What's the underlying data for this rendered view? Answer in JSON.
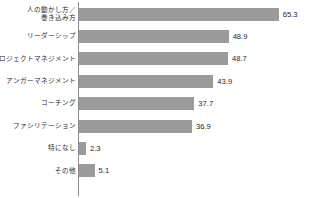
{
  "chart_data": {
    "type": "bar",
    "orientation": "horizontal",
    "title": "",
    "subtitle": "",
    "xlabel": "",
    "ylabel": "",
    "xlim": [
      0,
      70
    ],
    "grid": false,
    "legend": false,
    "bar_color": "#9b9b9b",
    "axis_color": "#8c8c8c",
    "value_label_suffix": "",
    "categories": [
      "人の動かし方／巻き込み方",
      "リーダーシップ",
      "プロジェクトマネジメント",
      "アンガーマネジメント",
      "コーチング",
      "ファシリテーション",
      "特になし",
      "その他"
    ],
    "values": [
      65.3,
      48.9,
      48.7,
      43.9,
      37.7,
      36.9,
      2.3,
      5.1
    ]
  },
  "bars": [
    {
      "label_line1": "人の動かし方／",
      "label_line2": "巻き込み方",
      "value": 65.3,
      "value_text": "65.3"
    },
    {
      "label_line1": "リーダーシップ",
      "label_line2": "",
      "value": 48.9,
      "value_text": "48.9"
    },
    {
      "label_line1": "プロジェクトマネジメント",
      "label_line2": "",
      "value": 48.7,
      "value_text": "48.7"
    },
    {
      "label_line1": "アンガーマネジメント",
      "label_line2": "",
      "value": 43.9,
      "value_text": "43.9"
    },
    {
      "label_line1": "コーチング",
      "label_line2": "",
      "value": 37.7,
      "value_text": "37.7"
    },
    {
      "label_line1": "ファシリテーション",
      "label_line2": "",
      "value": 36.9,
      "value_text": "36.9"
    },
    {
      "label_line1": "特になし",
      "label_line2": "",
      "value": 2.3,
      "value_text": "2.3"
    },
    {
      "label_line1": "その他",
      "label_line2": "",
      "value": 5.1,
      "value_text": "5.1"
    }
  ],
  "layout": {
    "row_height": 22.4,
    "first_row_top": 3,
    "axis_x": 78,
    "px_per_unit": 3.06
  }
}
